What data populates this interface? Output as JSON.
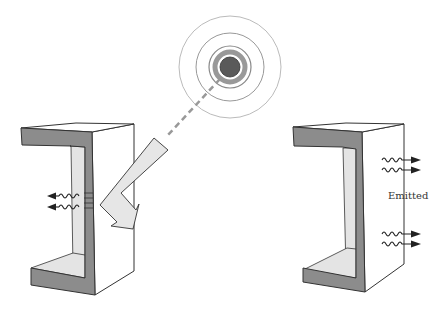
{
  "diagram": {
    "source": {
      "name": "radiation-source",
      "rings": 4
    },
    "incident": {
      "name": "incident-beam"
    },
    "left_object": {
      "name": "c-channel-absorbing",
      "outgoing_waves": 2,
      "direction": "left"
    },
    "right_object": {
      "name": "c-channel-emitting",
      "outgoing_waves": 4,
      "direction": "right"
    },
    "labels": {
      "emitted": "Emitted"
    },
    "colors": {
      "front_face": "#8c8c8c",
      "inner_face": "#e4e4e4",
      "side_face": "#ffffff",
      "outline": "#333333",
      "core": "#595959",
      "ring": "#9a9a9a",
      "beam_fill": "#e6e6e6"
    }
  }
}
